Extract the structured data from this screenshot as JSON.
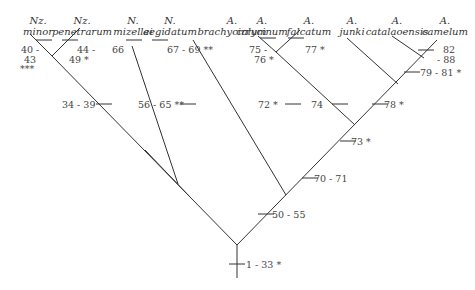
{
  "taxa": [
    {
      "genus": "Nz.",
      "species": "minor"
    },
    {
      "genus": "Nz.",
      "species": "penetrarum"
    },
    {
      "genus": "N.",
      "species": "mizellei"
    },
    {
      "genus": "N.",
      "species": "aegidatum"
    },
    {
      "genus": "A.",
      "species": "brachycirrum"
    },
    {
      "genus": "A.",
      "species": "calycinum"
    },
    {
      "genus": "A.",
      "species": "falcatum"
    },
    {
      "genus": "A.",
      "species": "junki"
    },
    {
      "genus": "A.",
      "species": "catalaoensis"
    },
    {
      "genus": "A.",
      "species": "camelum"
    }
  ],
  "character_labels": {
    "minor_a": "40 -",
    "minor_b": "43",
    "minor_c": "***",
    "penetrarum_a": "44 -",
    "penetrarum_b": "49 *",
    "mizellei": "66",
    "aegidatum": "67 - 69 **",
    "calycinum_a": "75 -",
    "calycinum_b": "76 *",
    "falcatum": "77 *",
    "camelum_a": "82",
    "camelum_b": "- 88",
    "node_nz": "34 - 39",
    "node_n": "56 - 65 **",
    "node_72": "72 *",
    "node_74": "74",
    "node_78": "78 *",
    "node_79": "79 - 81 *",
    "node_73": "73 *",
    "node_70": "70 - 71",
    "node_50": "50 - 55",
    "root": "1 - 33 *"
  },
  "colors": {
    "line": "#333333",
    "text": "#333333"
  }
}
